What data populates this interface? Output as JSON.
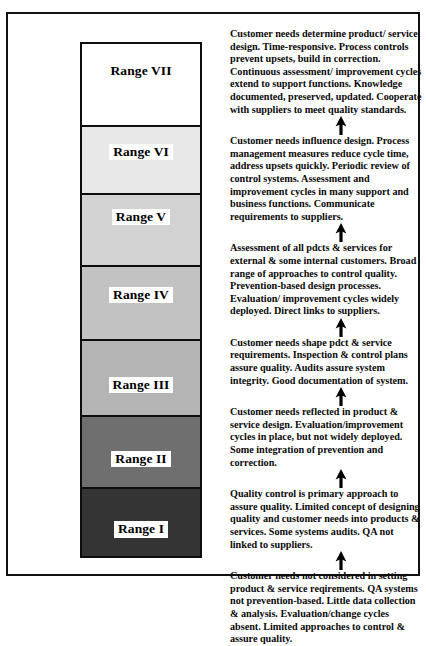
{
  "figure": {
    "title_present": false,
    "type": "maturity-ladder-diagram",
    "orientation": "vertical-ascending"
  },
  "ladder": {
    "caption": "Seven-level quality maturity ladder, darkest (lowest maturity) at bottom to white (highest maturity) at top",
    "bands": [
      {
        "label": "Range VII",
        "level": 7,
        "fill": "#ffffff",
        "height_px": 83,
        "label_boxed": false,
        "label_offset": "lab-shift-up"
      },
      {
        "label": "Range VI",
        "level": 6,
        "fill": "#e8e8e8",
        "height_px": 68,
        "label_boxed": true,
        "label_offset": "lab-shift-up-s"
      },
      {
        "label": "Range V",
        "level": 5,
        "fill": "#d2d2d2",
        "height_px": 72,
        "label_boxed": true,
        "label_offset": "lab-shift-up"
      },
      {
        "label": "Range IV",
        "level": 4,
        "fill": "#c2c2c2",
        "height_px": 74,
        "label_boxed": true,
        "label_offset": "lab-shift-up-s"
      },
      {
        "label": "Range III",
        "level": 3,
        "fill": "#b4b4b4",
        "height_px": 76,
        "label_boxed": true,
        "label_offset": "lab-shift-dn"
      },
      {
        "label": "Range II",
        "level": 2,
        "fill": "#6f6f6f",
        "height_px": 72,
        "label_boxed": true,
        "label_offset": "lab-shift-dn"
      },
      {
        "label": "Range I",
        "level": 1,
        "fill": "#343434",
        "height_px": 71,
        "label_boxed": true,
        "label_offset": "lab-shift-dn"
      }
    ]
  },
  "descriptions": [
    {
      "for_level": 7,
      "text": "Customer needs determine product/ service design. Time-responsive. Process controls prevent upsets, build in correction. Continuous assessment/ improvement cycles extend to support functions. Knowledge documented, preserved, updated.  Cooperate with suppliers to meet quality standards."
    },
    {
      "for_level": 6,
      "text": "Customer needs influence design. Process management measures reduce cycle time, address upsets quickly. Periodic review of control systems. Assessment and improvement cycles in many support and business functions. Communicate requirements to suppliers."
    },
    {
      "for_level": 5,
      "text": "Assessment of all pdcts & services for external & some internal customers. Broad range of approaches to control quality. Prevention-based design processes.  Evaluation/ improvement cycles widely deployed. Direct links to suppliers."
    },
    {
      "for_level": 4,
      "text": "Customer needs shape pdct & service requirements. Inspection & control plans assure quality.  Audits assure system integrity.  Good documentation of system."
    },
    {
      "for_level": 3,
      "text": "Customer needs  reflected in product & service design. Evaluation/improvement cycles in place, but not widely deployed. Some integration of prevention and correction."
    },
    {
      "for_level": 2,
      "text": "Quality control is primary approach to assure quality. Limited concept of designing quality and customer needs into products & services. Some systems audits.  QA not linked to suppliers."
    },
    {
      "for_level": 1,
      "text": "Customer needs not considered in setting product & service reqirements. QA  systems not prevention-based. Little  data collection &  analysis. Evaluation/change cycles absent. Limited approaches to control & assure quality."
    }
  ],
  "arrows": {
    "glyph_name": "up-arrow-icon",
    "count": 6,
    "direction": "up",
    "color": "#000000"
  },
  "colors": {
    "frame": "#111111",
    "band_border": "#0d0d0d",
    "text": "#0a0a0a",
    "page_background": "#ffffff"
  }
}
